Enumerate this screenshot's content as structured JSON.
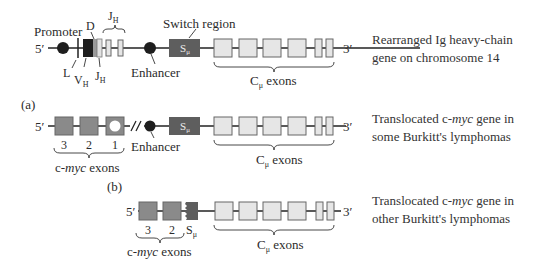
{
  "figure": {
    "panel_top": {
      "labels": {
        "five_prime": "5′",
        "three_prime": "3′",
        "promoter": "Promoter",
        "D": "D",
        "JH_top": "J",
        "JH_top_sub": "H",
        "switch_region": "Switch region",
        "s_mu": "S",
        "s_mu_sub": "μ",
        "L": "L",
        "VH": "V",
        "VH_sub": "H",
        "JH_bottom": "J",
        "JH_bottom_sub": "H",
        "enhancer": "Enhancer",
        "c_mu_exons": "C",
        "c_mu_sub": "μ",
        "c_mu_exons_word": " exons"
      },
      "description_line1": "Rearranged Ig heavy-chain",
      "description_line2": "gene on chromosome 14"
    },
    "panel_a": {
      "tag": "(a)",
      "labels": {
        "five_prime": "5′",
        "three_prime": "3′",
        "exon3": "3",
        "exon2": "2",
        "exon1": "1",
        "enhancer": "Enhancer",
        "s_mu": "S",
        "s_mu_sub": "μ",
        "myc_exons_prefix": "c-",
        "myc_exons_gene": "myc",
        "myc_exons_suffix": " exons",
        "c_mu_exons": "C",
        "c_mu_sub": "μ",
        "c_mu_exons_word": " exons"
      },
      "description_line1_prefix": "Translocated c-",
      "description_line1_gene": "myc",
      "description_line1_suffix": " gene in",
      "description_line2": "some Burkitt's lymphomas"
    },
    "panel_b": {
      "tag": "(b)",
      "labels": {
        "five_prime": "5′",
        "three_prime": "3′",
        "exon3": "3",
        "exon2": "2",
        "s_mu": "S",
        "s_mu_sub": "μ",
        "myc_exons_prefix": "c-",
        "myc_exons_gene": "myc",
        "myc_exons_suffix": " exons",
        "c_mu_exons": "C",
        "c_mu_sub": "μ",
        "c_mu_exons_word": " exons"
      },
      "description_line1_prefix": "Translocated c-",
      "description_line1_gene": "myc",
      "description_line1_suffix": " gene in",
      "description_line2": "other Burkitt's lymphomas"
    },
    "colors": {
      "c_exon_fill": "#e6e6e6",
      "myc_exon_fill": "#8a8a8a",
      "switch_region_fill": "#5e5e5e",
      "enhancer_fill": "#1e1e1e",
      "vh_fill": "#1e1e1e"
    }
  }
}
